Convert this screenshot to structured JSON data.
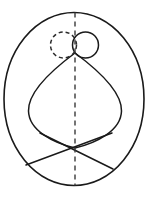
{
  "figure": {
    "title": "Geometric line diagram",
    "canvas": {
      "width": 152,
      "height": 199,
      "background_color": "#ffffff",
      "stroke_color": "#1a1a1a"
    },
    "elements": {
      "outer_ellipse": {
        "name": "outer-ellipse",
        "center_x": 74,
        "center_y": 99,
        "radius_x": 70,
        "radius_y": 87,
        "style": "solid"
      },
      "axis_line": {
        "name": "vertical-dashed-axis",
        "x": 75,
        "y_top": 12,
        "y_bottom": 186,
        "style": "dashed",
        "dash_pattern": "5 4"
      },
      "circle_dashed": {
        "name": "small-dashed-circle",
        "center_x": 63,
        "center_y": 45,
        "radius": 13,
        "style": "dashed"
      },
      "circle_solid": {
        "name": "small-solid-circle",
        "center_x": 85,
        "center_y": 45,
        "radius": 13,
        "style": "solid"
      },
      "leaf_shape": {
        "name": "leaf-lens-shape",
        "apex_x": 75,
        "apex_y": 53,
        "bottom_x": 75,
        "bottom_y": 148,
        "left_x": 28,
        "right_x": 122,
        "waist_y": 108,
        "style": "solid"
      },
      "chord_left_down": {
        "name": "diagonal-chord-left-down",
        "x1": 112,
        "y1": 133,
        "x2": 26,
        "y2": 165,
        "style": "solid"
      },
      "chord_right_down": {
        "name": "diagonal-chord-right-down",
        "x1": 40,
        "y1": 133,
        "x2": 113,
        "y2": 169,
        "style": "solid"
      },
      "crossing_point": {
        "name": "chord-intersection-point",
        "x": 75,
        "y": 149
      }
    }
  }
}
